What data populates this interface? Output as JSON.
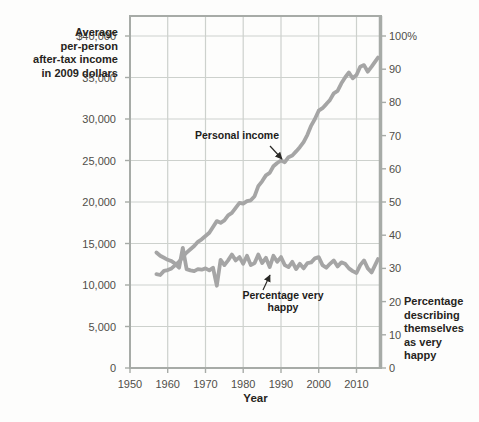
{
  "figure": {
    "left_axis_label": "Average\nper-person\nafter-tax income\nin 2009 dollars",
    "right_axis_label": "Percentage\ndescribing\nthemselves\nas very happy",
    "x_axis_label": "Year",
    "annotations": {
      "income": "Personal income",
      "happiness": "Percentage very happy"
    }
  },
  "colors": {
    "line_gray": "#a5a5a5",
    "grid": "#cdd1cd",
    "frame": "#a7aba7",
    "tick_text": "#504e49",
    "annotation_arrow": "#2a2926",
    "background": "#fdfdfc"
  },
  "chart_data": {
    "type": "line",
    "title": "",
    "xlabel": "Year",
    "ylabel_left": "Average per-person after-tax income in 2009 dollars",
    "ylabel_right": "Percentage describing themselves as very happy",
    "x_range": [
      1950,
      2016.5
    ],
    "y_left_range": [
      0,
      40000
    ],
    "y_right_range": [
      0,
      100
    ],
    "grid": true,
    "legend_position": "none",
    "x_ticks": [
      {
        "v": 1950,
        "label": "1950"
      },
      {
        "v": 1960,
        "label": "1960"
      },
      {
        "v": 1970,
        "label": "1970"
      },
      {
        "v": 1980,
        "label": "1980"
      },
      {
        "v": 1990,
        "label": "1990"
      },
      {
        "v": 2000,
        "label": "2000"
      },
      {
        "v": 2010,
        "label": "2010"
      }
    ],
    "y_ticks_left": [
      {
        "v": 40000,
        "label": "$40,000"
      },
      {
        "v": 35000,
        "label": "35,000"
      },
      {
        "v": 30000,
        "label": "30,000"
      },
      {
        "v": 25000,
        "label": "25,000"
      },
      {
        "v": 20000,
        "label": "20,000"
      },
      {
        "v": 15000,
        "label": "15,000"
      },
      {
        "v": 10000,
        "label": "10,000"
      },
      {
        "v": 5000,
        "label": "5,000"
      },
      {
        "v": 0,
        "label": "0"
      }
    ],
    "y_ticks_right": [
      {
        "v": 100,
        "label": "100%"
      },
      {
        "v": 90,
        "label": "90"
      },
      {
        "v": 80,
        "label": "80"
      },
      {
        "v": 70,
        "label": "70"
      },
      {
        "v": 60,
        "label": "60"
      },
      {
        "v": 50,
        "label": "50"
      },
      {
        "v": 40,
        "label": "40"
      },
      {
        "v": 30,
        "label": "30"
      },
      {
        "v": 20,
        "label": "20"
      },
      {
        "v": 10,
        "label": "10"
      },
      {
        "v": 0,
        "label": "0"
      }
    ],
    "series": [
      {
        "name": "Personal income",
        "axis": "left",
        "units": "2009 dollars",
        "points": [
          [
            1957,
            11300
          ],
          [
            1958,
            11200
          ],
          [
            1959,
            11700
          ],
          [
            1960,
            11800
          ],
          [
            1961,
            12000
          ],
          [
            1962,
            12400
          ],
          [
            1963,
            12800
          ],
          [
            1964,
            13400
          ],
          [
            1965,
            13900
          ],
          [
            1966,
            14300
          ],
          [
            1967,
            14700
          ],
          [
            1968,
            15200
          ],
          [
            1969,
            15500
          ],
          [
            1970,
            15900
          ],
          [
            1971,
            16300
          ],
          [
            1972,
            17000
          ],
          [
            1973,
            17700
          ],
          [
            1974,
            17500
          ],
          [
            1975,
            17800
          ],
          [
            1976,
            18400
          ],
          [
            1977,
            18700
          ],
          [
            1978,
            19300
          ],
          [
            1979,
            19900
          ],
          [
            1980,
            19800
          ],
          [
            1981,
            20100
          ],
          [
            1982,
            20200
          ],
          [
            1983,
            20700
          ],
          [
            1984,
            21900
          ],
          [
            1985,
            22500
          ],
          [
            1986,
            23200
          ],
          [
            1987,
            23500
          ],
          [
            1988,
            24300
          ],
          [
            1989,
            24700
          ],
          [
            1990,
            25000
          ],
          [
            1991,
            24800
          ],
          [
            1992,
            25400
          ],
          [
            1993,
            25600
          ],
          [
            1994,
            26100
          ],
          [
            1995,
            26600
          ],
          [
            1996,
            27200
          ],
          [
            1997,
            28100
          ],
          [
            1998,
            29200
          ],
          [
            1999,
            30000
          ],
          [
            2000,
            31000
          ],
          [
            2001,
            31300
          ],
          [
            2002,
            31800
          ],
          [
            2003,
            32300
          ],
          [
            2004,
            33100
          ],
          [
            2005,
            33400
          ],
          [
            2006,
            34300
          ],
          [
            2007,
            35000
          ],
          [
            2008,
            35600
          ],
          [
            2009,
            34900
          ],
          [
            2010,
            35300
          ],
          [
            2011,
            36300
          ],
          [
            2012,
            36500
          ],
          [
            2013,
            35700
          ],
          [
            2014,
            36300
          ],
          [
            2015.7,
            37400
          ]
        ]
      },
      {
        "name": "Percentage very happy",
        "axis": "right",
        "units": "percent",
        "points": [
          [
            1957,
            34.8
          ],
          [
            1958,
            33.8
          ],
          [
            1959,
            33.2
          ],
          [
            1960,
            32.6
          ],
          [
            1961,
            32.2
          ],
          [
            1962,
            31.4
          ],
          [
            1963,
            30.2
          ],
          [
            1964,
            36.2
          ],
          [
            1965,
            29.8
          ],
          [
            1966,
            29.4
          ],
          [
            1967,
            29.2
          ],
          [
            1968,
            29.8
          ],
          [
            1969,
            29.6
          ],
          [
            1970,
            30.0
          ],
          [
            1971,
            29.4
          ],
          [
            1972,
            30.2
          ],
          [
            1973,
            24.8
          ],
          [
            1974,
            32.6
          ],
          [
            1975,
            31.0
          ],
          [
            1976,
            32.4
          ],
          [
            1977,
            34.2
          ],
          [
            1978,
            32.4
          ],
          [
            1979,
            33.4
          ],
          [
            1980,
            31.4
          ],
          [
            1981,
            33.8
          ],
          [
            1982,
            31.0
          ],
          [
            1983,
            31.6
          ],
          [
            1984,
            34.2
          ],
          [
            1985,
            31.6
          ],
          [
            1986,
            33.2
          ],
          [
            1987,
            30.4
          ],
          [
            1988,
            33.8
          ],
          [
            1989,
            32.0
          ],
          [
            1990,
            33.4
          ],
          [
            1991,
            31.0
          ],
          [
            1992,
            30.4
          ],
          [
            1993,
            32.0
          ],
          [
            1994,
            29.8
          ],
          [
            1995,
            31.4
          ],
          [
            1996,
            30.0
          ],
          [
            1997,
            31.6
          ],
          [
            1998,
            31.8
          ],
          [
            1999,
            33.0
          ],
          [
            2000,
            33.4
          ],
          [
            2001,
            31.0
          ],
          [
            2002,
            30.2
          ],
          [
            2003,
            31.4
          ],
          [
            2004,
            32.4
          ],
          [
            2005,
            30.6
          ],
          [
            2006,
            31.8
          ],
          [
            2007,
            31.4
          ],
          [
            2008,
            30.0
          ],
          [
            2009,
            29.2
          ],
          [
            2010,
            28.6
          ],
          [
            2011,
            31.0
          ],
          [
            2012,
            32.4
          ],
          [
            2013,
            30.0
          ],
          [
            2014,
            28.8
          ],
          [
            2015.7,
            32.8
          ]
        ]
      }
    ]
  }
}
